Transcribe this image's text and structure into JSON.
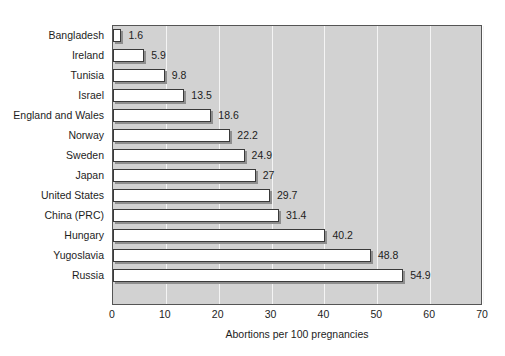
{
  "chart_data": {
    "type": "bar",
    "orientation": "horizontal",
    "title": "",
    "xlabel": "Abortions per 100 pregnancies",
    "ylabel": "",
    "categories": [
      "Bangladesh",
      "Ireland",
      "Tunisia",
      "Israel",
      "England and Wales",
      "Norway",
      "Sweden",
      "Japan",
      "United States",
      "China (PRC)",
      "Hungary",
      "Yugoslavia",
      "Russia"
    ],
    "values": [
      1.6,
      5.9,
      9.8,
      13.5,
      18.6,
      22.2,
      24.9,
      27,
      29.7,
      31.4,
      40.2,
      48.8,
      54.9
    ],
    "value_labels": [
      "1.6",
      "5.9",
      "9.8",
      "13.5",
      "18.6",
      "22.2",
      "24.9",
      "27",
      "29.7",
      "31.4",
      "40.2",
      "48.8",
      "54.9"
    ],
    "xlim": [
      0,
      70
    ],
    "xticks": [
      0,
      10,
      20,
      30,
      40,
      50,
      60,
      70
    ],
    "xtick_labels": [
      "0",
      "10",
      "20",
      "30",
      "40",
      "50",
      "60",
      "70"
    ],
    "grid": "vertical-white-gridlines",
    "legend": "none",
    "colors": {
      "plot_background": "#d2d2d2",
      "bar_fill": "#ffffff",
      "bar_border": "#3a3a3a",
      "bar_shadow": "#8e8e8e",
      "gridline": "#f4f4f4",
      "frame": "#555555",
      "text": "#1d1d1d",
      "page_background": "#ffffff"
    }
  }
}
